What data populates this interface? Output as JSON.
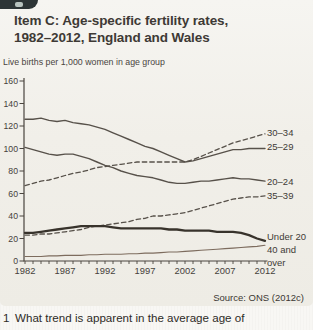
{
  "panel": {
    "title_line1": "Item C: Age-specific fertility rates,",
    "title_line2": "1982–2012, England and Wales",
    "source": "Source: ONS (2012c)"
  },
  "question": {
    "number": "1",
    "text": "What trend is apparent in the average age of"
  },
  "chart_data": {
    "type": "line",
    "title": "Item C: Age-specific fertility rates, 1982–2012, England and Wales",
    "unit_label": "Live births per 1,000 women in age group",
    "xlabel": "",
    "ylabel": "",
    "ylim": [
      0,
      160
    ],
    "y_ticks": [
      0,
      20,
      40,
      60,
      80,
      100,
      120,
      140,
      160
    ],
    "x_tick_labels": [
      "1982",
      "1987",
      "1992",
      "1997",
      "2002",
      "2007",
      "2012"
    ],
    "grid": false,
    "legend_position": "right-of-lines",
    "years": [
      1982,
      1983,
      1984,
      1985,
      1986,
      1987,
      1988,
      1989,
      1990,
      1991,
      1992,
      1993,
      1994,
      1995,
      1996,
      1997,
      1998,
      1999,
      2000,
      2001,
      2002,
      2003,
      2004,
      2005,
      2006,
      2007,
      2008,
      2009,
      2010,
      2011,
      2012
    ],
    "series": [
      {
        "name": "30–34",
        "style": "dashed",
        "values": [
          67,
          69,
          71,
          72,
          74,
          76,
          78,
          79,
          81,
          83,
          84,
          85,
          86,
          87,
          88,
          88,
          88,
          88,
          88,
          88,
          88,
          90,
          93,
          96,
          99,
          102,
          105,
          107,
          109,
          111,
          113
        ],
        "label_top": 127
      },
      {
        "name": "25–29",
        "style": "solid",
        "values": [
          126,
          126,
          127,
          125,
          124,
          125,
          123,
          122,
          121,
          119,
          117,
          114,
          111,
          108,
          105,
          102,
          100,
          97,
          94,
          91,
          88,
          89,
          91,
          93,
          95,
          97,
          99,
          99,
          100,
          100,
          100
        ],
        "label_top": 141
      },
      {
        "name": "20–24",
        "style": "solid",
        "values": [
          101,
          99,
          97,
          95,
          94,
          95,
          95,
          93,
          91,
          88,
          85,
          83,
          80,
          78,
          76,
          75,
          74,
          72,
          70,
          69,
          69,
          70,
          71,
          71,
          72,
          73,
          74,
          73,
          73,
          72,
          71
        ],
        "label_top": 176
      },
      {
        "name": "35–39",
        "style": "dashed",
        "values": [
          23,
          23,
          24,
          24,
          25,
          26,
          27,
          28,
          30,
          31,
          32,
          33,
          34,
          35,
          37,
          38,
          40,
          40,
          41,
          42,
          43,
          45,
          47,
          49,
          51,
          53,
          55,
          56,
          57,
          57,
          58
        ],
        "label_top": 190
      },
      {
        "name": "Under 20",
        "style": "solid-thick",
        "values": [
          25,
          25,
          26,
          27,
          28,
          29,
          30,
          31,
          31,
          31,
          31,
          30,
          29,
          29,
          29,
          29,
          29,
          29,
          28,
          28,
          27,
          27,
          27,
          27,
          26,
          26,
          26,
          25,
          23,
          20,
          18
        ],
        "label_top": 231
      },
      {
        "name": "40 and over",
        "style": "solid-thin",
        "values": [
          4,
          4,
          4,
          4.5,
          4.5,
          5,
          5,
          5,
          5.5,
          5.5,
          6,
          6,
          6,
          6.5,
          6.5,
          7,
          7,
          7.5,
          8,
          8,
          8.5,
          9,
          9.5,
          10,
          10.5,
          11,
          11.5,
          12,
          12.5,
          13,
          14
        ],
        "label_top": 244
      }
    ],
    "colors": {
      "line": "#57514a",
      "thick_line": "#38332c",
      "thin_line": "#7d6c5e",
      "axis": "#4a453f",
      "tick_label": "#45413b",
      "panel_bg": "#f1efe9",
      "tab_bg": "#2d3536"
    }
  }
}
